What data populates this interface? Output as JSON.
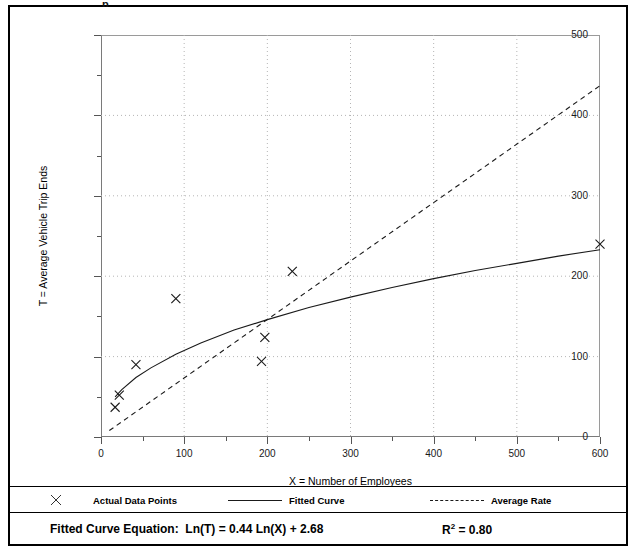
{
  "figure": {
    "title_fragment": "p",
    "legend": [
      {
        "label": "Actual Data Points",
        "symbol": "x-marker"
      },
      {
        "label": "Fitted Curve",
        "symbol": "solid-line"
      },
      {
        "label": "Average Rate",
        "symbol": "dashed-line"
      }
    ],
    "equation_label": "Fitted Curve Equation:",
    "equation": "Ln(T) = 0.44 Ln(X) + 2.68",
    "r_squared_label": "R",
    "r_squared_exp": "2",
    "r_squared_value": " = 0.80"
  },
  "chart_data": {
    "type": "scatter",
    "title": "",
    "xlabel": "X = Number of Employees",
    "ylabel": "T = Average Vehicle Trip Ends",
    "xlim": [
      0,
      600
    ],
    "ylim": [
      0,
      500
    ],
    "xticks": [
      0,
      100,
      200,
      300,
      400,
      500,
      600
    ],
    "yticks": [
      0,
      100,
      200,
      300,
      400,
      500
    ],
    "xminor_step": 50,
    "yminor_step": 50,
    "grid": true,
    "grid_style": "dotted",
    "legend_position": "bottom",
    "series": [
      {
        "name": "Actual Data Points",
        "type": "scatter",
        "marker": "x",
        "color": "#1a1a1a",
        "points": [
          {
            "x": 17,
            "y": 37
          },
          {
            "x": 22,
            "y": 52
          },
          {
            "x": 42,
            "y": 90
          },
          {
            "x": 90,
            "y": 172
          },
          {
            "x": 193,
            "y": 94
          },
          {
            "x": 197,
            "y": 124
          },
          {
            "x": 230,
            "y": 206
          },
          {
            "x": 600,
            "y": 240
          }
        ]
      },
      {
        "name": "Fitted Curve",
        "type": "line",
        "style": "solid",
        "color": "#1a1a1a",
        "equation": "T = exp(2.68) * X^0.44",
        "x_start": 17,
        "x_end": 600,
        "points": [
          {
            "x": 17,
            "y": 50
          },
          {
            "x": 25,
            "y": 59
          },
          {
            "x": 42,
            "y": 74
          },
          {
            "x": 60,
            "y": 86
          },
          {
            "x": 90,
            "y": 103
          },
          {
            "x": 120,
            "y": 117
          },
          {
            "x": 160,
            "y": 133
          },
          {
            "x": 200,
            "y": 146
          },
          {
            "x": 250,
            "y": 161
          },
          {
            "x": 300,
            "y": 174
          },
          {
            "x": 350,
            "y": 186
          },
          {
            "x": 400,
            "y": 197
          },
          {
            "x": 450,
            "y": 207
          },
          {
            "x": 500,
            "y": 216
          },
          {
            "x": 550,
            "y": 225
          },
          {
            "x": 600,
            "y": 233
          }
        ]
      },
      {
        "name": "Average Rate",
        "type": "line",
        "style": "dashed",
        "color": "#1a1a1a",
        "x_start": 10,
        "x_end": 600,
        "points": [
          {
            "x": 10,
            "y": 8
          },
          {
            "x": 600,
            "y": 437
          }
        ]
      }
    ]
  }
}
